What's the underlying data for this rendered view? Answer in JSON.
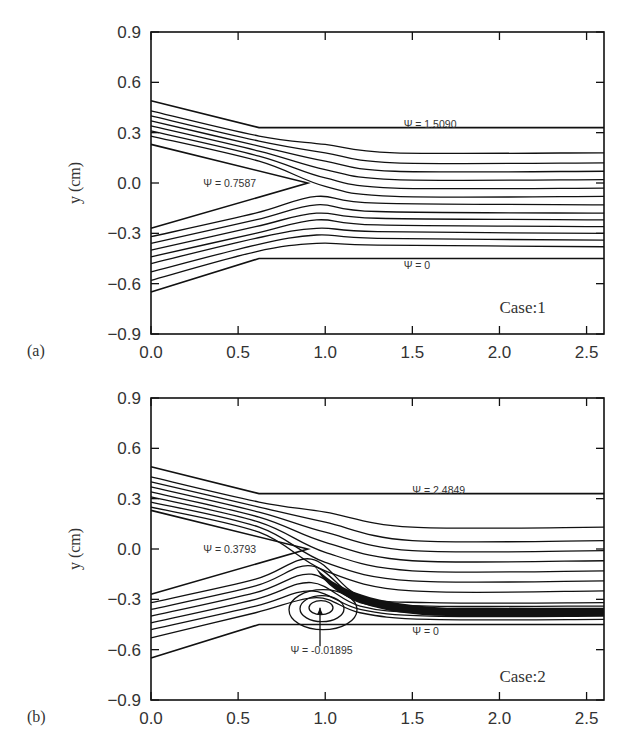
{
  "figure": {
    "panels": [
      {
        "id": "a",
        "panel_label": "(a)",
        "case_label": "Case:1",
        "ylabel": "y (cm)",
        "annotations": {
          "upper": "Ψ = 1.5090",
          "splitter": "Ψ = 0.7587",
          "lower": "Ψ = 0"
        }
      },
      {
        "id": "b",
        "panel_label": "(b)",
        "case_label": "Case:2",
        "ylabel": "y (cm)",
        "annotations": {
          "upper": "Ψ = 2.4849",
          "splitter": "Ψ = 0.3793",
          "lower": "Ψ = 0",
          "vortex": "Ψ = -0.01895"
        }
      }
    ],
    "colors": {
      "ink": "#111111",
      "text": "#333333",
      "background": "#ffffff"
    }
  },
  "chart_data": [
    {
      "type": "line",
      "title": "",
      "subtitle": "Streamlines — Case:1",
      "panel": "(a)",
      "xlabel": "",
      "ylabel": "y (cm)",
      "xlim": [
        0.0,
        2.6
      ],
      "ylim": [
        -0.9,
        0.9
      ],
      "xticks": [
        "0.0",
        "0.5",
        "1.0",
        "1.5",
        "2.0",
        "2.5"
      ],
      "yticks": [
        "0.9",
        "0.6",
        "0.3",
        "0.0",
        "-0.3",
        "-0.6",
        "-0.9"
      ],
      "grid": false,
      "legend": "none",
      "geometry": {
        "upper_inlet_wall": [
          [
            0.0,
            0.49
          ],
          [
            0.62,
            0.33
          ],
          [
            2.6,
            0.33
          ]
        ],
        "lower_inlet_wall": [
          [
            0.0,
            -0.65
          ],
          [
            0.62,
            -0.45
          ],
          [
            2.6,
            -0.45
          ]
        ],
        "splitter_plate": [
          [
            0.0,
            0.23
          ],
          [
            0.9,
            0.0
          ],
          [
            0.0,
            -0.27
          ]
        ]
      },
      "annotations": [
        {
          "text": "Ψ = 1.5090",
          "x": 1.45,
          "y": 0.35
        },
        {
          "text": "Ψ = 0.7587",
          "x": 0.3,
          "y": 0.0
        },
        {
          "text": "Ψ = 0",
          "x": 1.45,
          "y": -0.49
        },
        {
          "text": "Case:1",
          "x": 2.0,
          "y": -0.75
        }
      ],
      "series": [
        {
          "name": "upper stream 1",
          "points": [
            [
              0.0,
              0.43
            ],
            [
              0.62,
              0.28
            ],
            [
              1.0,
              0.23
            ],
            [
              1.4,
              0.18
            ],
            [
              2.6,
              0.18
            ]
          ]
        },
        {
          "name": "upper stream 2",
          "points": [
            [
              0.0,
              0.4
            ],
            [
              0.62,
              0.25
            ],
            [
              1.0,
              0.18
            ],
            [
              1.4,
              0.12
            ],
            [
              2.6,
              0.12
            ]
          ]
        },
        {
          "name": "upper stream 3",
          "points": [
            [
              0.0,
              0.37
            ],
            [
              0.62,
              0.22
            ],
            [
              1.0,
              0.13
            ],
            [
              1.4,
              0.07
            ],
            [
              2.6,
              0.07
            ]
          ]
        },
        {
          "name": "upper stream 4",
          "points": [
            [
              0.0,
              0.34
            ],
            [
              0.62,
              0.19
            ],
            [
              1.0,
              0.08
            ],
            [
              1.4,
              0.02
            ],
            [
              2.6,
              0.02
            ]
          ]
        },
        {
          "name": "upper stream 5",
          "points": [
            [
              0.0,
              0.31
            ],
            [
              0.62,
              0.16
            ],
            [
              1.0,
              0.03
            ],
            [
              1.4,
              -0.03
            ],
            [
              2.6,
              -0.03
            ]
          ]
        },
        {
          "name": "upper stream 6",
          "points": [
            [
              0.0,
              0.28
            ],
            [
              0.62,
              0.13
            ],
            [
              1.0,
              -0.02
            ],
            [
              1.4,
              -0.08
            ],
            [
              2.6,
              -0.08
            ]
          ]
        },
        {
          "name": "lower stream 1",
          "points": [
            [
              0.0,
              -0.32
            ],
            [
              0.6,
              -0.18
            ],
            [
              0.95,
              -0.08
            ],
            [
              1.3,
              -0.12
            ],
            [
              2.6,
              -0.13
            ]
          ]
        },
        {
          "name": "lower stream 2",
          "points": [
            [
              0.0,
              -0.36
            ],
            [
              0.6,
              -0.22
            ],
            [
              0.95,
              -0.13
            ],
            [
              1.3,
              -0.17
            ],
            [
              2.6,
              -0.18
            ]
          ]
        },
        {
          "name": "lower stream 3",
          "points": [
            [
              0.0,
              -0.4
            ],
            [
              0.6,
              -0.26
            ],
            [
              0.95,
              -0.18
            ],
            [
              1.3,
              -0.21
            ],
            [
              2.6,
              -0.22
            ]
          ]
        },
        {
          "name": "lower stream 4",
          "points": [
            [
              0.0,
              -0.44
            ],
            [
              0.6,
              -0.3
            ],
            [
              0.95,
              -0.22
            ],
            [
              1.3,
              -0.25
            ],
            [
              2.6,
              -0.26
            ]
          ]
        },
        {
          "name": "lower stream 5",
          "points": [
            [
              0.0,
              -0.48
            ],
            [
              0.6,
              -0.33
            ],
            [
              0.95,
              -0.27
            ],
            [
              1.3,
              -0.29
            ],
            [
              2.6,
              -0.3
            ]
          ]
        },
        {
          "name": "lower stream 6",
          "points": [
            [
              0.0,
              -0.53
            ],
            [
              0.6,
              -0.37
            ],
            [
              0.95,
              -0.31
            ],
            [
              1.3,
              -0.33
            ],
            [
              2.6,
              -0.34
            ]
          ]
        },
        {
          "name": "lower stream 7",
          "points": [
            [
              0.0,
              -0.58
            ],
            [
              0.6,
              -0.41
            ],
            [
              0.95,
              -0.36
            ],
            [
              1.3,
              -0.37
            ],
            [
              2.6,
              -0.38
            ]
          ]
        }
      ]
    },
    {
      "type": "line",
      "title": "",
      "subtitle": "Streamlines — Case:2",
      "panel": "(b)",
      "xlabel": "",
      "ylabel": "y (cm)",
      "xlim": [
        0.0,
        2.6
      ],
      "ylim": [
        -0.9,
        0.9
      ],
      "xticks": [
        "0.0",
        "0.5",
        "1.0",
        "1.5",
        "2.0",
        "2.5"
      ],
      "yticks": [
        "0.9",
        "0.6",
        "0.3",
        "0.0",
        "-0.3",
        "-0.6",
        "-0.9"
      ],
      "grid": false,
      "legend": "none",
      "geometry": {
        "upper_inlet_wall": [
          [
            0.0,
            0.49
          ],
          [
            0.62,
            0.33
          ],
          [
            2.6,
            0.33
          ]
        ],
        "lower_inlet_wall": [
          [
            0.0,
            -0.65
          ],
          [
            0.62,
            -0.45
          ],
          [
            2.6,
            -0.45
          ]
        ],
        "splitter_plate": [
          [
            0.0,
            0.23
          ],
          [
            0.9,
            0.0
          ],
          [
            0.0,
            -0.27
          ]
        ]
      },
      "recirculation": {
        "center": [
          0.97,
          -0.35
        ],
        "psi": -0.01895,
        "x_extent": [
          0.82,
          1.32
        ]
      },
      "annotations": [
        {
          "text": "Ψ = 2.4849",
          "x": 1.5,
          "y": 0.35
        },
        {
          "text": "Ψ = 0.3793",
          "x": 0.3,
          "y": 0.0
        },
        {
          "text": "Ψ = 0",
          "x": 1.5,
          "y": -0.49
        },
        {
          "text": "Ψ = -0.01895",
          "x": 0.8,
          "y": -0.6
        },
        {
          "text": "Case:2",
          "x": 2.0,
          "y": -0.77
        }
      ],
      "series": [
        {
          "name": "upper stream 1",
          "points": [
            [
              0.0,
              0.43
            ],
            [
              0.62,
              0.28
            ],
            [
              1.0,
              0.22
            ],
            [
              1.5,
              0.13
            ],
            [
              2.6,
              0.13
            ]
          ]
        },
        {
          "name": "upper stream 2",
          "points": [
            [
              0.0,
              0.4
            ],
            [
              0.62,
              0.25
            ],
            [
              1.0,
              0.16
            ],
            [
              1.5,
              0.05
            ],
            [
              2.6,
              0.05
            ]
          ]
        },
        {
          "name": "upper stream 3",
          "points": [
            [
              0.0,
              0.37
            ],
            [
              0.62,
              0.22
            ],
            [
              1.0,
              0.1
            ],
            [
              1.5,
              -0.01
            ],
            [
              2.6,
              -0.01
            ]
          ]
        },
        {
          "name": "upper stream 4",
          "points": [
            [
              0.0,
              0.34
            ],
            [
              0.62,
              0.19
            ],
            [
              1.0,
              0.04
            ],
            [
              1.5,
              -0.07
            ],
            [
              2.6,
              -0.07
            ]
          ]
        },
        {
          "name": "upper stream 5",
          "points": [
            [
              0.0,
              0.31
            ],
            [
              0.62,
              0.16
            ],
            [
              1.0,
              -0.02
            ],
            [
              1.5,
              -0.13
            ],
            [
              2.6,
              -0.13
            ]
          ]
        },
        {
          "name": "upper stream 6",
          "points": [
            [
              0.0,
              0.28
            ],
            [
              0.62,
              0.13
            ],
            [
              1.0,
              -0.08
            ],
            [
              1.5,
              -0.19
            ],
            [
              2.6,
              -0.19
            ]
          ]
        },
        {
          "name": "upper stream 7",
          "points": [
            [
              0.0,
              0.25
            ],
            [
              0.62,
              0.1
            ],
            [
              1.0,
              -0.13
            ],
            [
              1.5,
              -0.25
            ],
            [
              2.6,
              -0.25
            ]
          ]
        },
        {
          "name": "lower stream 1",
          "points": [
            [
              0.0,
              -0.32
            ],
            [
              0.6,
              -0.18
            ],
            [
              0.92,
              -0.06
            ],
            [
              1.2,
              -0.28
            ],
            [
              1.6,
              -0.32
            ],
            [
              2.6,
              -0.32
            ]
          ]
        },
        {
          "name": "lower stream 2",
          "points": [
            [
              0.0,
              -0.36
            ],
            [
              0.6,
              -0.22
            ],
            [
              0.92,
              -0.1
            ],
            [
              1.2,
              -0.3
            ],
            [
              1.6,
              -0.34
            ],
            [
              2.6,
              -0.34
            ]
          ]
        },
        {
          "name": "lower stream 3",
          "points": [
            [
              0.0,
              -0.4
            ],
            [
              0.6,
              -0.26
            ],
            [
              0.92,
              -0.15
            ],
            [
              1.2,
              -0.32
            ],
            [
              1.6,
              -0.36
            ],
            [
              2.6,
              -0.36
            ]
          ]
        },
        {
          "name": "lower stream 4",
          "points": [
            [
              0.0,
              -0.44
            ],
            [
              0.6,
              -0.3
            ],
            [
              0.92,
              -0.2
            ],
            [
              1.2,
              -0.34
            ],
            [
              1.6,
              -0.38
            ],
            [
              2.6,
              -0.38
            ]
          ]
        },
        {
          "name": "lower stream 5",
          "points": [
            [
              0.0,
              -0.48
            ],
            [
              0.6,
              -0.34
            ],
            [
              0.92,
              -0.25
            ],
            [
              1.2,
              -0.36
            ],
            [
              1.6,
              -0.4
            ],
            [
              2.6,
              -0.4
            ]
          ]
        },
        {
          "name": "lower stream 6",
          "points": [
            [
              0.0,
              -0.53
            ],
            [
              0.6,
              -0.38
            ],
            [
              0.95,
              -0.29
            ],
            [
              1.2,
              -0.38
            ],
            [
              1.6,
              -0.42
            ],
            [
              2.6,
              -0.42
            ]
          ]
        }
      ]
    }
  ]
}
